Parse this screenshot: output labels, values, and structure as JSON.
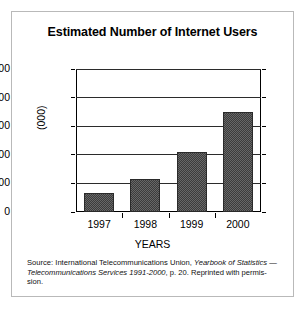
{
  "figure": {
    "title": "Estimated Number of Internet Users",
    "ylabel": "(000)",
    "xlabel": "YEARS",
    "caption": {
      "line1_plain": "Source: International Telecommunications Union, ",
      "line1_italic": "Yearbook of Statistics",
      "line2_italic": "— Telecommunications Services 1991-2000",
      "line2_plain": ", p. 20. Reprinted with permis-",
      "line3_plain": "sion."
    }
  },
  "chart_data": {
    "type": "bar",
    "title": "Estimated Number of Internet Users",
    "xlabel": "YEARS",
    "ylabel": "(000)",
    "categories": [
      "1997",
      "1998",
      "1999",
      "2000"
    ],
    "values": [
      390,
      690,
      1250,
      2100
    ],
    "ylim": [
      0,
      3000
    ],
    "yticks": [
      0,
      600,
      1200,
      1800,
      2400,
      3000
    ],
    "ytick_labels": [
      "0",
      "600",
      "1,200",
      "1,800",
      "2,400",
      "3,000"
    ],
    "grid": true,
    "legend": "none",
    "bar_color": "#3c3c3c",
    "bar_pattern": "dotted-checker"
  }
}
